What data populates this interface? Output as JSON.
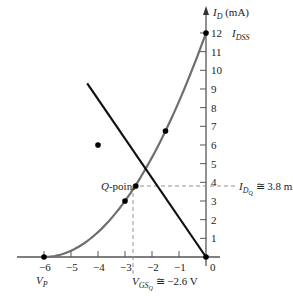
{
  "chart_data": {
    "type": "line",
    "title": "",
    "xlabel": "V_GS (V)",
    "ylabel": "I_D (mA)",
    "xlim": [
      -6,
      0
    ],
    "ylim": [
      0,
      12
    ],
    "grid": false,
    "x_ticks": [
      -6,
      -5,
      -4,
      -3,
      -2,
      -1,
      0
    ],
    "x_tick_labels": [
      "−6",
      "−5",
      "−4",
      "−3",
      "−2",
      "−1",
      "0"
    ],
    "y_ticks": [
      1,
      2,
      3,
      4,
      5,
      6,
      7,
      8,
      9,
      10,
      11,
      12
    ],
    "y_tick_labels": [
      "1",
      "2",
      "3",
      "4",
      "5",
      "6",
      "7",
      "8",
      "9",
      "10",
      "11",
      "12"
    ],
    "series": [
      {
        "name": "Transfer curve (Shockley)",
        "color": "#6e6e6e",
        "x": [
          -6,
          -4,
          -3,
          -2.6,
          -1.5,
          0
        ],
        "y": [
          0,
          1.33,
          3,
          3.8,
          6.75,
          12
        ],
        "points": [
          [
            -6,
            0
          ],
          [
            -4,
            1.33
          ],
          [
            -3,
            3
          ],
          [
            -1.5,
            6.75
          ],
          [
            0,
            12
          ]
        ]
      },
      {
        "name": "Bias (load) line",
        "color": "#111111",
        "x": [
          -4.4,
          0
        ],
        "y": [
          9.3,
          0
        ],
        "points": [
          [
            -4,
            6
          ],
          [
            0,
            0
          ]
        ]
      }
    ],
    "annotations": {
      "y_axis_label": "I_D (mA)",
      "idss_value": "12",
      "idss_label": "I_DSS",
      "vp_label": "V_P",
      "q_point_label": "Q-point",
      "idq_label": "I_DQ ≅ 3.8 mA",
      "vgsq_label": "V_GSQ ≅ −2.6 V",
      "q_point": [
        -2.6,
        3.8
      ]
    }
  },
  "labels": {
    "id_axis": "I",
    "id_sub": "D",
    "id_unit": " (mA)",
    "idss_I": "I",
    "idss_sub": "DSS",
    "vp_V": "V",
    "vp_sub": "P",
    "q_italic": "Q",
    "q_rest": "-point",
    "idq_I": "I",
    "idq_sub": "D",
    "idq_subsub": "Q",
    "idq_value": " ≅ 3.8 mA",
    "vgsq_V": "V",
    "vgsq_sub": "GS",
    "vgsq_subsub": "Q",
    "vgsq_value": " ≅ −2.6 V"
  }
}
